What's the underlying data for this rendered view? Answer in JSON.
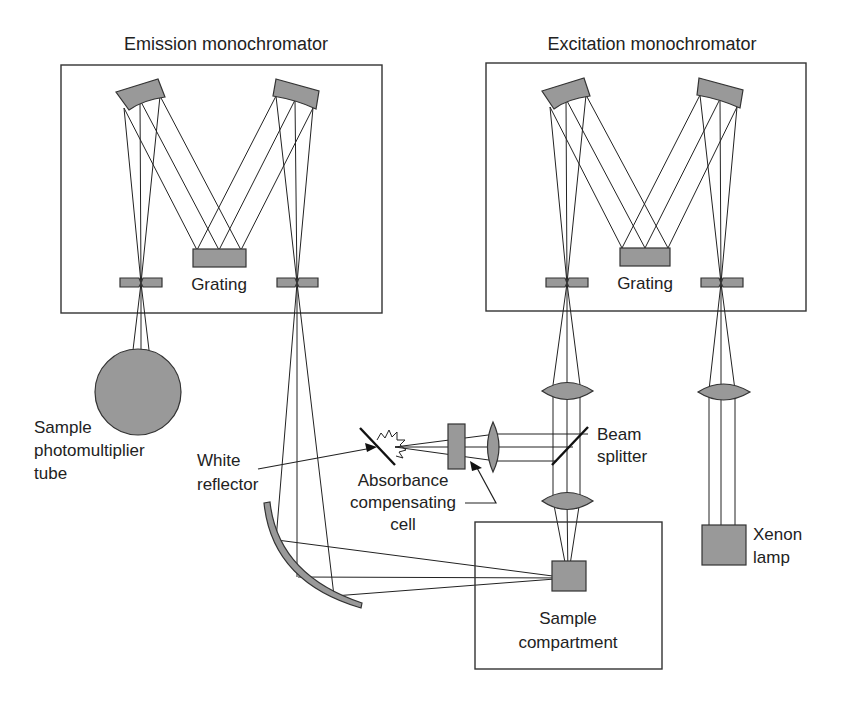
{
  "diagram": {
    "colors": {
      "component_fill": "#999999",
      "line": "#222222",
      "background": "#ffffff"
    },
    "labels": {
      "emission_monochromator": "Emission monochromator",
      "excitation_monochromator": "Excitation monochromator",
      "emission_grating": "Grating",
      "excitation_grating": "Grating",
      "sample_pmt_line1": "Sample",
      "sample_pmt_line2": "photomultiplier",
      "sample_pmt_line3": "tube",
      "white_reflector_line1": "White",
      "white_reflector_line2": "reflector",
      "absorbance_line1": "Absorbance",
      "absorbance_line2": "compensating",
      "absorbance_line3": "cell",
      "beam_splitter_line1": "Beam",
      "beam_splitter_line2": "splitter",
      "xenon_line1": "Xenon",
      "xenon_line2": "lamp",
      "sample_compartment_line1": "Sample",
      "sample_compartment_line2": "compartment"
    }
  }
}
